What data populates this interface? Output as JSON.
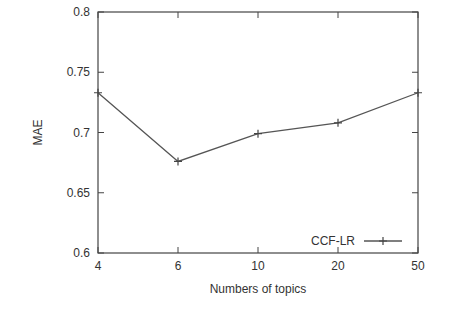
{
  "chart_data": {
    "type": "line",
    "title": "",
    "xlabel": "Numbers of topics",
    "ylabel": "MAE",
    "categories": [
      "4",
      "6",
      "10",
      "20",
      "50"
    ],
    "series": [
      {
        "name": "CCF-LR",
        "values": [
          0.733,
          0.676,
          0.699,
          0.708,
          0.733
        ],
        "marker": "+"
      }
    ],
    "ylim": [
      0.6,
      0.8
    ],
    "yticks": [
      "0.6",
      "0.65",
      "0.7",
      "0.75",
      "0.8"
    ],
    "grid": false,
    "legend_position": "lower right"
  }
}
